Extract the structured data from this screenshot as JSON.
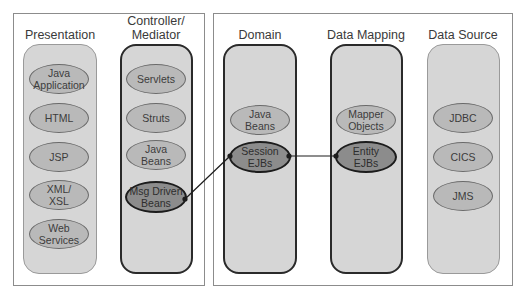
{
  "diagram": {
    "panels": [
      {
        "name": "presentation-tier-panel"
      },
      {
        "name": "business-tier-panel"
      }
    ],
    "columns": [
      {
        "id": "presentation",
        "title": "Presentation",
        "style": "light",
        "nodes": [
          {
            "id": "java-application",
            "label": "Java\nApplication",
            "highlight": false
          },
          {
            "id": "html",
            "label": "HTML",
            "highlight": false
          },
          {
            "id": "jsp",
            "label": "JSP",
            "highlight": false
          },
          {
            "id": "xml-xsl",
            "label": "XML/\nXSL",
            "highlight": false
          },
          {
            "id": "web-services",
            "label": "Web\nServices",
            "highlight": false
          }
        ]
      },
      {
        "id": "controller",
        "title": "Controller/\nMediator",
        "style": "dark",
        "nodes": [
          {
            "id": "servlets",
            "label": "Servlets",
            "highlight": false
          },
          {
            "id": "struts",
            "label": "Struts",
            "highlight": false
          },
          {
            "id": "java-beans-ctrl",
            "label": "Java\nBeans",
            "highlight": false
          },
          {
            "id": "msg-driven-beans",
            "label": "Msg Driven\nBeans",
            "highlight": true
          }
        ]
      },
      {
        "id": "domain",
        "title": "Domain",
        "style": "dark",
        "nodes": [
          {
            "id": "java-beans-domain",
            "label": "Java\nBeans",
            "highlight": false
          },
          {
            "id": "session-ejbs",
            "label": "Session\nEJBs",
            "highlight": true
          }
        ]
      },
      {
        "id": "data-mapping",
        "title": "Data Mapping",
        "style": "dark",
        "nodes": [
          {
            "id": "mapper-objects",
            "label": "Mapper\nObjects",
            "highlight": false
          },
          {
            "id": "entity-ejbs",
            "label": "Entity\nEJBs",
            "highlight": true
          }
        ]
      },
      {
        "id": "data-source",
        "title": "Data Source",
        "style": "light",
        "nodes": [
          {
            "id": "jdbc",
            "label": "JDBC",
            "highlight": false
          },
          {
            "id": "cics",
            "label": "CICS",
            "highlight": false
          },
          {
            "id": "jms",
            "label": "JMS",
            "highlight": false
          }
        ]
      }
    ],
    "connections": [
      {
        "from": "msg-driven-beans",
        "to": "session-ejbs"
      },
      {
        "from": "session-ejbs",
        "to": "entity-ejbs"
      }
    ],
    "colors": {
      "column_fill": "#d6d6d6",
      "node_fill": "#b9b9b9",
      "highlight_node_fill": "#8c8c8c",
      "connector": "#1c1c1c"
    }
  }
}
